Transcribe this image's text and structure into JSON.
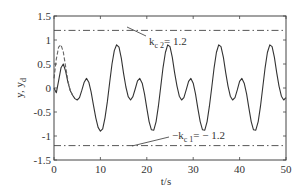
{
  "chart_data": {
    "type": "line",
    "title": "",
    "xlabel": "t/s",
    "ylabel": "y, y_d",
    "xlim": [
      0,
      50
    ],
    "ylim": [
      -1.5,
      1.5
    ],
    "xticks": [
      "0",
      "10",
      "20",
      "30",
      "40",
      "50"
    ],
    "yticks": [
      "1.5",
      "1",
      "0.5",
      "0",
      "-0.5",
      "-1",
      "-1.5"
    ],
    "grid": false,
    "legend": null,
    "series": [
      {
        "name": "y",
        "style": "solid",
        "x": [
          0,
          0.5,
          1,
          1.5,
          2,
          2.5,
          3,
          3.5,
          4,
          4.5,
          5,
          5.5,
          6,
          6.5,
          7,
          7.5,
          8,
          8.5,
          9,
          9.5,
          10,
          10.5,
          11,
          11.5,
          12,
          12.5,
          13,
          13.5,
          14,
          14.5,
          15,
          15.5,
          16,
          16.5,
          17,
          17.5,
          18,
          18.5,
          19,
          19.5,
          20,
          20.5,
          21,
          21.5,
          22,
          22.5,
          23,
          23.5,
          24,
          24.5,
          25,
          25.5,
          26,
          26.5,
          27,
          27.5,
          28,
          28.5,
          29,
          29.5,
          30,
          30.5,
          31,
          31.5,
          32,
          32.5,
          33,
          33.5,
          34,
          34.5,
          35,
          35.5,
          36,
          36.5,
          37,
          37.5,
          38,
          38.5,
          39,
          39.5,
          40,
          40.5,
          41,
          41.5,
          42,
          42.5,
          43,
          43.5,
          44,
          44.5,
          45,
          45.5,
          46,
          46.5,
          47,
          47.5,
          48,
          48.5,
          49,
          49.5,
          50
        ],
        "values": [
          0.0,
          -0.1,
          0.15,
          0.42,
          0.5,
          0.35,
          0.12,
          -0.05,
          -0.15,
          -0.22,
          -0.25,
          -0.2,
          -0.05,
          0.12,
          0.2,
          0.12,
          -0.08,
          -0.35,
          -0.62,
          -0.82,
          -0.9,
          -0.85,
          -0.62,
          -0.28,
          0.12,
          0.5,
          0.78,
          0.9,
          0.85,
          0.62,
          0.3,
          0.02,
          -0.18,
          -0.25,
          -0.18,
          -0.02,
          0.15,
          0.2,
          0.1,
          -0.12,
          -0.42,
          -0.7,
          -0.87,
          -0.88,
          -0.7,
          -0.38,
          0.02,
          0.42,
          0.74,
          0.9,
          0.86,
          0.64,
          0.32,
          0.04,
          -0.17,
          -0.25,
          -0.2,
          -0.04,
          0.14,
          0.2,
          0.1,
          -0.12,
          -0.42,
          -0.7,
          -0.87,
          -0.88,
          -0.7,
          -0.38,
          0.02,
          0.42,
          0.74,
          0.9,
          0.86,
          0.64,
          0.32,
          0.04,
          -0.17,
          -0.25,
          -0.2,
          -0.04,
          0.14,
          0.2,
          0.1,
          -0.12,
          -0.42,
          -0.7,
          -0.87,
          -0.88,
          -0.7,
          -0.38,
          0.02,
          0.42,
          0.74,
          0.9,
          0.86,
          0.64,
          0.32,
          0.04,
          -0.17,
          -0.25,
          -0.2
        ]
      },
      {
        "name": "y_d",
        "style": "dashed",
        "x": [
          0,
          0.5,
          1,
          1.5,
          2,
          2.5,
          3,
          3.5,
          4
        ],
        "values": [
          0.2,
          0.6,
          0.85,
          0.9,
          0.75,
          0.45,
          0.15,
          -0.05,
          -0.15
        ]
      }
    ],
    "reference_lines": [
      {
        "name": "k_c2",
        "y": 1.2,
        "style": "dashdot",
        "label": "k_c2 = 1.2"
      },
      {
        "name": "-k_c1",
        "y": -1.2,
        "style": "dashdot",
        "label": "-k_c1 = -1.2"
      }
    ]
  },
  "labels": {
    "xlabel": "t/s",
    "ylabel_main": "y, y",
    "ylabel_sub": "d",
    "kc2_prefix": "k",
    "kc2_sub": "c 2",
    "kc2_value": "= 1.2",
    "kc1_prefix": "−k",
    "kc1_sub": "c 1",
    "kc1_value": "= − 1.2"
  }
}
